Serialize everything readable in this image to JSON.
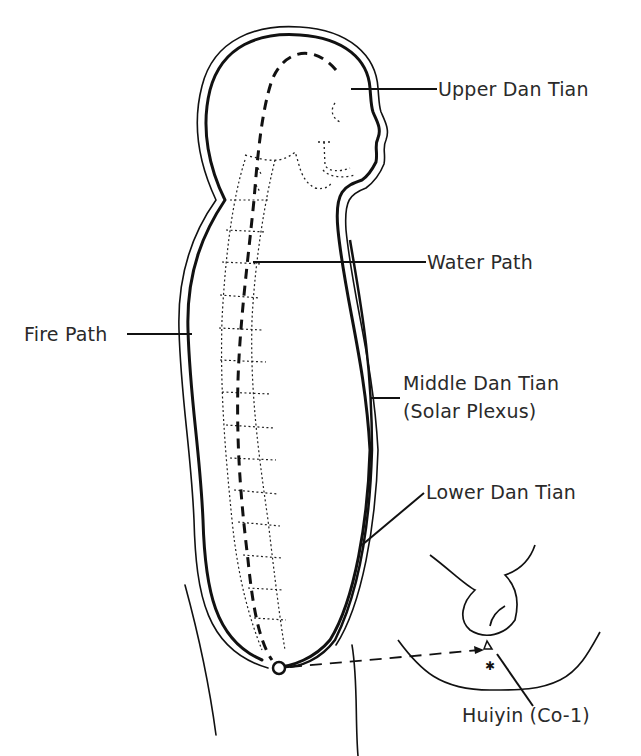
{
  "diagram": {
    "labels": {
      "upper_dan_tian": "Upper Dan Tian",
      "water_path": "Water Path",
      "fire_path": "Fire Path",
      "middle_dan_tian_line1": "Middle Dan Tian",
      "middle_dan_tian_line2": "(Solar Plexus)",
      "lower_dan_tian": "Lower Dan Tian",
      "huiyin": "Huiyin (Co-1)"
    },
    "colors": {
      "ink": "#111111",
      "text": "#2a2a2a",
      "background": "#ffffff"
    }
  }
}
